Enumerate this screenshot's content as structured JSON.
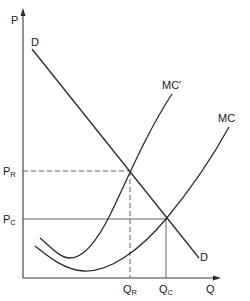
{
  "diagram": {
    "type": "supply-demand",
    "axes": {
      "y_label": "P",
      "x_label": "Q"
    },
    "curves": {
      "demand": {
        "label_top": "D",
        "label_bottom": "D"
      },
      "mc_shifted": {
        "label": "MC′"
      },
      "mc": {
        "label": "MC"
      }
    },
    "price_levels": [
      {
        "main": "P",
        "sub": "R",
        "style": "dashed"
      },
      {
        "main": "P",
        "sub": "C",
        "style": "solid"
      }
    ],
    "quantity_levels": [
      {
        "main": "Q",
        "sub": "R",
        "style": "dashed"
      },
      {
        "main": "Q",
        "sub": "C",
        "style": "solid"
      }
    ],
    "colors": {
      "line": "#2b2b2b",
      "background": "#ffffff"
    }
  }
}
